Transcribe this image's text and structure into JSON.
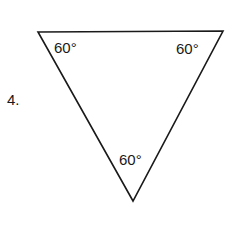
{
  "problem": {
    "number": "4.",
    "angles": [
      {
        "label": "60°",
        "vertex": "top-left"
      },
      {
        "label": "60°",
        "vertex": "top-right"
      },
      {
        "label": "60°",
        "vertex": "bottom"
      }
    ]
  },
  "colors": {
    "stroke": "#1a1a1a",
    "background": "#ffffff"
  }
}
